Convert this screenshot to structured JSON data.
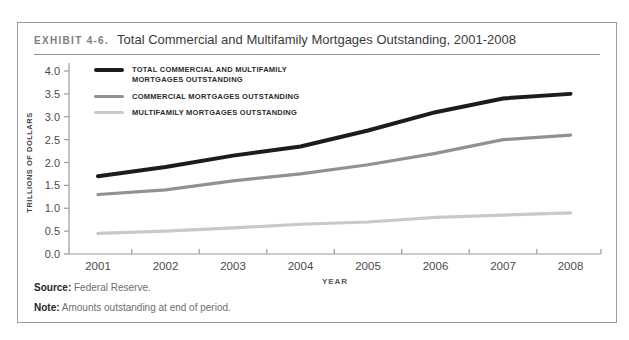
{
  "exhibit": {
    "label": "EXHIBIT 4-6.",
    "title": "Total Commercial and Multifamily Mortgages Outstanding, 2001-2008"
  },
  "source": {
    "label": "Source:",
    "text": "Federal Reserve."
  },
  "note": {
    "label": "Note:",
    "text": "Amounts outstanding at end of period."
  },
  "chart_data": {
    "type": "line",
    "x": [
      2001,
      2002,
      2003,
      2004,
      2005,
      2006,
      2007,
      2008
    ],
    "xlabel": "YEAR",
    "ylabel": "TRILLIONS OF DOLLARS",
    "ylim": [
      0,
      4.0
    ],
    "ytick_step": 0.5,
    "grid": false,
    "legend_position": "top-left-inside",
    "axis_color": "#9a9a9a",
    "tick_label_color": "#4b4b4b",
    "series": [
      {
        "name": "TOTAL COMMERCIAL AND MULTIFAMILY MORTGAGES OUTSTANDING",
        "color": "#1c1c1c",
        "stroke_width": 4,
        "values": [
          1.7,
          1.9,
          2.15,
          2.35,
          2.7,
          3.1,
          3.4,
          3.5
        ]
      },
      {
        "name": "COMMERCIAL MORTGAGES OUTSTANDING",
        "color": "#919191",
        "stroke_width": 3.2,
        "values": [
          1.3,
          1.4,
          1.6,
          1.75,
          1.95,
          2.2,
          2.5,
          2.6
        ]
      },
      {
        "name": "MULTIFAMILY MORTGAGES OUTSTANDING",
        "color": "#c9c9c9",
        "stroke_width": 3.2,
        "values": [
          0.45,
          0.5,
          0.57,
          0.65,
          0.7,
          0.8,
          0.85,
          0.9
        ]
      }
    ]
  }
}
